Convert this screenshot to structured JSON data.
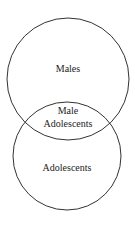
{
  "diagram": {
    "type": "venn",
    "sets": [
      {
        "label": "Males"
      },
      {
        "label": "Adolescents"
      }
    ],
    "intersection": {
      "line1": "Male",
      "line2": "Adolescents"
    },
    "stroke_color": "#333333"
  }
}
